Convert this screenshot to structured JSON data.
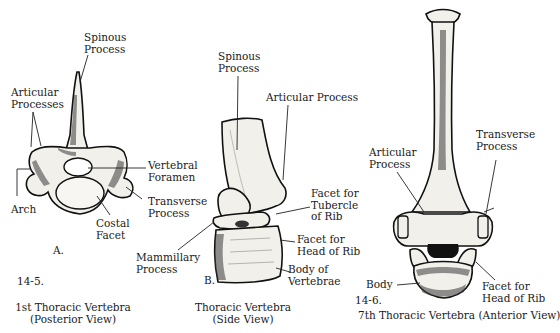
{
  "figures": [
    {
      "id": "A",
      "panel_letter": "A.",
      "figure_number": "14-5.",
      "caption_line1": "1st Thoracic Vertebra",
      "caption_line2": "(Posterior View)",
      "labels": {
        "spinous_process": [
          "Spinous",
          "Process"
        ],
        "articular_processes": [
          "Articular",
          "Processes"
        ],
        "vertebral_foramen": [
          "Vertebral",
          "Foramen"
        ],
        "transverse_process": [
          "Transverse",
          "Process"
        ],
        "costal_facet": [
          "Costal",
          "Facet"
        ],
        "arch": [
          "Arch"
        ]
      }
    },
    {
      "id": "B",
      "panel_letter": "B.",
      "caption_line1": "Thoracic Vertebra",
      "caption_line2": "(Side View)",
      "labels": {
        "spinous_process": [
          "Spinous",
          "Process"
        ],
        "articular_process": [
          "Articular Process"
        ],
        "facet_tubercle": [
          "Facet for",
          "Tubercle",
          "of Rib"
        ],
        "facet_head": [
          "Facet for",
          "Head of Rib"
        ],
        "body": [
          "Body of",
          "Vertebrae"
        ],
        "mammillary_process": [
          "Mammillary",
          "Process"
        ]
      }
    },
    {
      "id": "C",
      "figure_number": "14-6.",
      "caption_line1": "7th Thoracic Vertebra (Anterior View)",
      "labels": {
        "articular_process": [
          "Articular",
          "Process"
        ],
        "transverse_process": [
          "Transverse",
          "Process"
        ],
        "body": [
          "Body"
        ],
        "facet_head": [
          "Facet for",
          "Head of Rib"
        ]
      }
    }
  ]
}
